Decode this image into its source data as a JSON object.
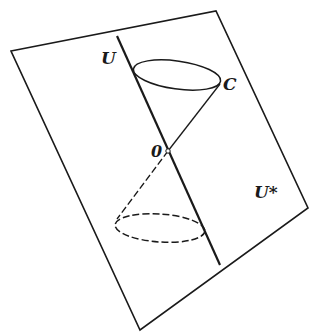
{
  "diagram": {
    "type": "light-cone-geometry",
    "labels": {
      "line_label": "U",
      "cone_label": "C",
      "origin_label": "0",
      "plane_label": "U*"
    },
    "colors": {
      "stroke": "#1a1a1a",
      "background": "#ffffff"
    },
    "plane": {
      "corners": [
        [
          11,
          51
        ],
        [
          216,
          11
        ],
        [
          308,
          208
        ],
        [
          140,
          330
        ]
      ]
    },
    "line_U": {
      "start": [
        117,
        36
      ],
      "end": [
        220,
        265
      ]
    },
    "origin": [
      168,
      151
    ],
    "upper_ellipse": {
      "cx": 177,
      "cy": 75,
      "rx": 44,
      "ry": 14,
      "style": "solid"
    },
    "lower_ellipse": {
      "cx": 160,
      "cy": 228,
      "rx": 45,
      "ry": 14,
      "style": "dashed"
    }
  }
}
